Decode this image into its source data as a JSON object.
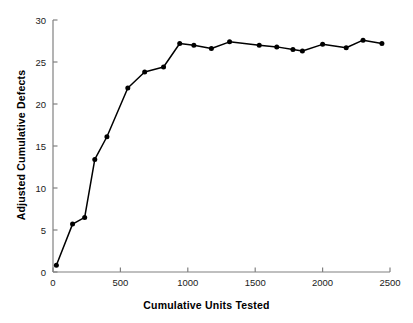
{
  "chart_data": {
    "type": "line",
    "title": "",
    "xlabel": "Cumulative Units Tested",
    "ylabel": "Adjusted Cumulative Defects",
    "xlim": [
      0,
      2500
    ],
    "ylim": [
      0,
      30
    ],
    "xticks": [
      0,
      500,
      1000,
      1500,
      2000,
      2500
    ],
    "yticks": [
      0,
      5,
      10,
      15,
      20,
      25,
      30
    ],
    "xtick_labels": [
      "0",
      "500",
      "1000",
      "1500",
      "2000",
      "2500"
    ],
    "ytick_labels": [
      "0",
      "5",
      "10",
      "15",
      "20",
      "25",
      "30"
    ],
    "grid": false,
    "legend": false,
    "marker": "filled-circle",
    "line_color": "#000000",
    "marker_color": "#000000",
    "axis_color": "#808080",
    "series": [
      {
        "name": "Adjusted Cumulative Defects",
        "x": [
          25,
          145,
          235,
          310,
          400,
          555,
          680,
          820,
          940,
          1045,
          1175,
          1310,
          1530,
          1660,
          1780,
          1850,
          2000,
          2175,
          2300,
          2440
        ],
        "y": [
          0.8,
          5.7,
          6.5,
          13.4,
          16.1,
          21.9,
          23.8,
          24.4,
          27.2,
          27.0,
          26.6,
          27.4,
          27.0,
          26.8,
          26.5,
          26.3,
          27.1,
          26.7,
          27.6,
          27.2
        ]
      }
    ]
  }
}
